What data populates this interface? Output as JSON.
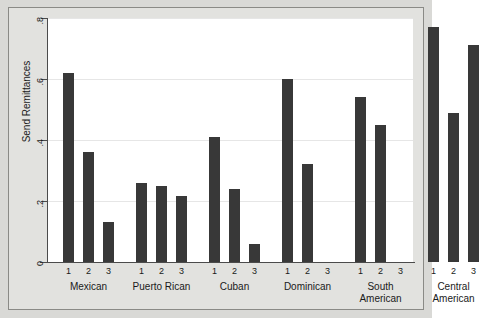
{
  "chart_data": {
    "type": "bar",
    "title": "",
    "subtitle": "",
    "xlabel": "",
    "ylabel": "Send Remittances",
    "ylim": [
      0,
      0.8
    ],
    "yticks": [
      "0",
      ".2",
      ".4",
      ".6",
      ".8"
    ],
    "ytick_values": [
      0,
      0.2,
      0.4,
      0.6,
      0.8
    ],
    "grid": true,
    "legend": "none",
    "within_group_tick_labels": [
      "1",
      "2",
      "3"
    ],
    "categories": [
      "Mexican",
      "Puerto Rican",
      "Cuban",
      "Dominican",
      "South American",
      "Central American"
    ],
    "series": [
      {
        "name": "1",
        "values": [
          0.62,
          0.26,
          0.41,
          0.6,
          0.54,
          0.77
        ]
      },
      {
        "name": "2",
        "values": [
          0.36,
          0.25,
          0.24,
          0.32,
          0.45,
          0.49
        ]
      },
      {
        "name": "3",
        "values": [
          0.13,
          0.215,
          0.06,
          null,
          null,
          0.71
        ]
      }
    ],
    "groups": [
      {
        "label": "Mexican",
        "label_lines": [
          "Mexican"
        ],
        "bars": [
          {
            "tick": "1",
            "value": 0.62
          },
          {
            "tick": "2",
            "value": 0.36
          },
          {
            "tick": "3",
            "value": 0.13
          }
        ]
      },
      {
        "label": "Puerto Rican",
        "label_lines": [
          "Puerto Rican"
        ],
        "bars": [
          {
            "tick": "1",
            "value": 0.26
          },
          {
            "tick": "2",
            "value": 0.25
          },
          {
            "tick": "3",
            "value": 0.215
          }
        ]
      },
      {
        "label": "Cuban",
        "label_lines": [
          "Cuban"
        ],
        "bars": [
          {
            "tick": "1",
            "value": 0.41
          },
          {
            "tick": "2",
            "value": 0.24
          },
          {
            "tick": "3",
            "value": 0.06
          }
        ]
      },
      {
        "label": "Dominican",
        "label_lines": [
          "Dominican"
        ],
        "bars": [
          {
            "tick": "1",
            "value": 0.6
          },
          {
            "tick": "2",
            "value": 0.32
          },
          {
            "tick": "3",
            "value": null
          }
        ]
      },
      {
        "label": "South American",
        "label_lines": [
          "South",
          "American"
        ],
        "bars": [
          {
            "tick": "1",
            "value": 0.54
          },
          {
            "tick": "2",
            "value": 0.45
          },
          {
            "tick": "3",
            "value": null
          }
        ]
      },
      {
        "label": "Central American",
        "label_lines": [
          "Central",
          "American"
        ],
        "bars": [
          {
            "tick": "1",
            "value": 0.77
          },
          {
            "tick": "2",
            "value": 0.49
          },
          {
            "tick": "3",
            "value": 0.71
          }
        ]
      }
    ],
    "colors": {
      "bar": "#383838",
      "plot_background": "#ffffff",
      "figure_background": "#e2e2df",
      "outer_background": "#d9d9d6",
      "axis": "#4b4b4b",
      "gridline": "#e6e6e6",
      "text": "#1a1a1a"
    }
  }
}
